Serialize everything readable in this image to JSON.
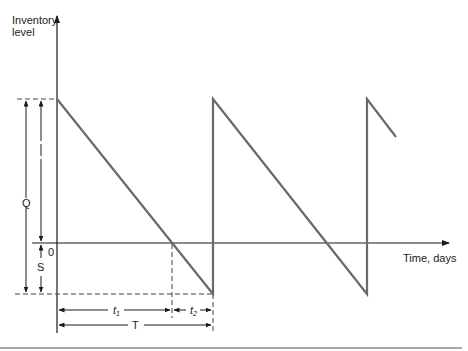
{
  "diagram": {
    "type": "inventory-sawtooth-with-shortages",
    "y_axis_label_line1": "Inventory",
    "y_axis_label_line2": "level",
    "x_axis_label": "Time, days",
    "origin_label": "0",
    "labels": {
      "Q": "Q",
      "S": "S",
      "t1": "t",
      "t1_sub": "1",
      "t2": "t",
      "t2_sub": "2",
      "T": "T"
    },
    "colors": {
      "sawtooth": "#6a6a6a",
      "axis": "#1a1a1a",
      "dashed": "#444444",
      "bottom_rule": "#888888"
    },
    "geometry_px": {
      "y_axis_x": 57,
      "zero_level_y": 243,
      "max_level_y": 99,
      "min_level_y": 294,
      "cycle_starts_x": [
        57,
        213,
        367
      ],
      "cycle_zero_cross_x": 172,
      "cycle_end_x": 213
    }
  }
}
